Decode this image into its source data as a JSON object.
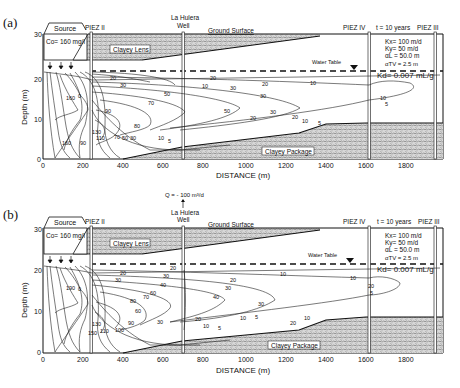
{
  "figure": {
    "panels": [
      {
        "id": "a",
        "letter": "(a)",
        "pumping_label": "",
        "source_label": "Source",
        "source_conc": "Co= 160 mg/l",
        "piez2": "PIEZ II",
        "piez3": "PIEZ III",
        "piez4": "PIEZ IV",
        "well_line1": "La Hulera",
        "well_line2": "Well",
        "ground_surface": "Ground Surface",
        "time": "t = 10 years",
        "clayey_lens": "Clayey Lens",
        "clayey_package": "Clayey Package",
        "water_table": "Water Table",
        "params": {
          "kx": "Kx= 100 m/d",
          "ky": "Ky=   50 m/d",
          "al": "αL  = 50.0 m",
          "atv": "αTV = 2.5 m",
          "kd": "Kd= 0.007 mL/g"
        },
        "contour_labels": [
          "20",
          "30",
          "20",
          "30",
          "50",
          "10",
          "5",
          "70",
          "50",
          "30",
          "20",
          "10",
          "5",
          "80",
          "70",
          "50",
          "30",
          "10",
          "5",
          "130",
          "110",
          "90",
          "160",
          "0",
          "10",
          "5",
          "5",
          "10",
          "20",
          "30",
          "10"
        ]
      },
      {
        "id": "b",
        "letter": "(b)",
        "pumping_label": "Q = - 100 m³/d",
        "source_label": "Source",
        "source_conc": "Co= 160 mg/l",
        "piez2": "PIEZ II",
        "piez3": "PIEZ III",
        "piez4": "PIEZ IV",
        "well_line1": "La Hulera",
        "well_line2": "Well",
        "ground_surface": "Ground Surface",
        "time": "t = 10 years",
        "clayey_lens": "Clayey Lens",
        "clayey_package": "Clayey Package",
        "water_table": "Water Table",
        "params": {
          "kx": "Kx= 100 m/d",
          "ky": "Ky=   50 m/d",
          "al": "αL  = 50.0 m",
          "atv": "αTV = 2.5 m",
          "kd": "Kd= 0.007 mL/g"
        },
        "contour_labels": [
          "20",
          "30",
          "40",
          "20",
          "30",
          "40",
          "20",
          "10",
          "60",
          "70",
          "80",
          "90",
          "100",
          "110",
          "130",
          "150",
          "190",
          "0",
          "30",
          "20",
          "10",
          "5",
          "60",
          "30",
          "10",
          "5",
          "20",
          "10",
          "5",
          "10",
          "20",
          "30"
        ]
      }
    ],
    "x_axis": {
      "title": "DISTANCE (m)",
      "ticks": [
        "0",
        "200",
        "400",
        "600",
        "800",
        "1000",
        "1200",
        "1400",
        "1600",
        "1800"
      ]
    },
    "y_axis": {
      "title": "Depth (m)",
      "ticks": [
        "0",
        "10",
        "20",
        "30"
      ]
    }
  }
}
